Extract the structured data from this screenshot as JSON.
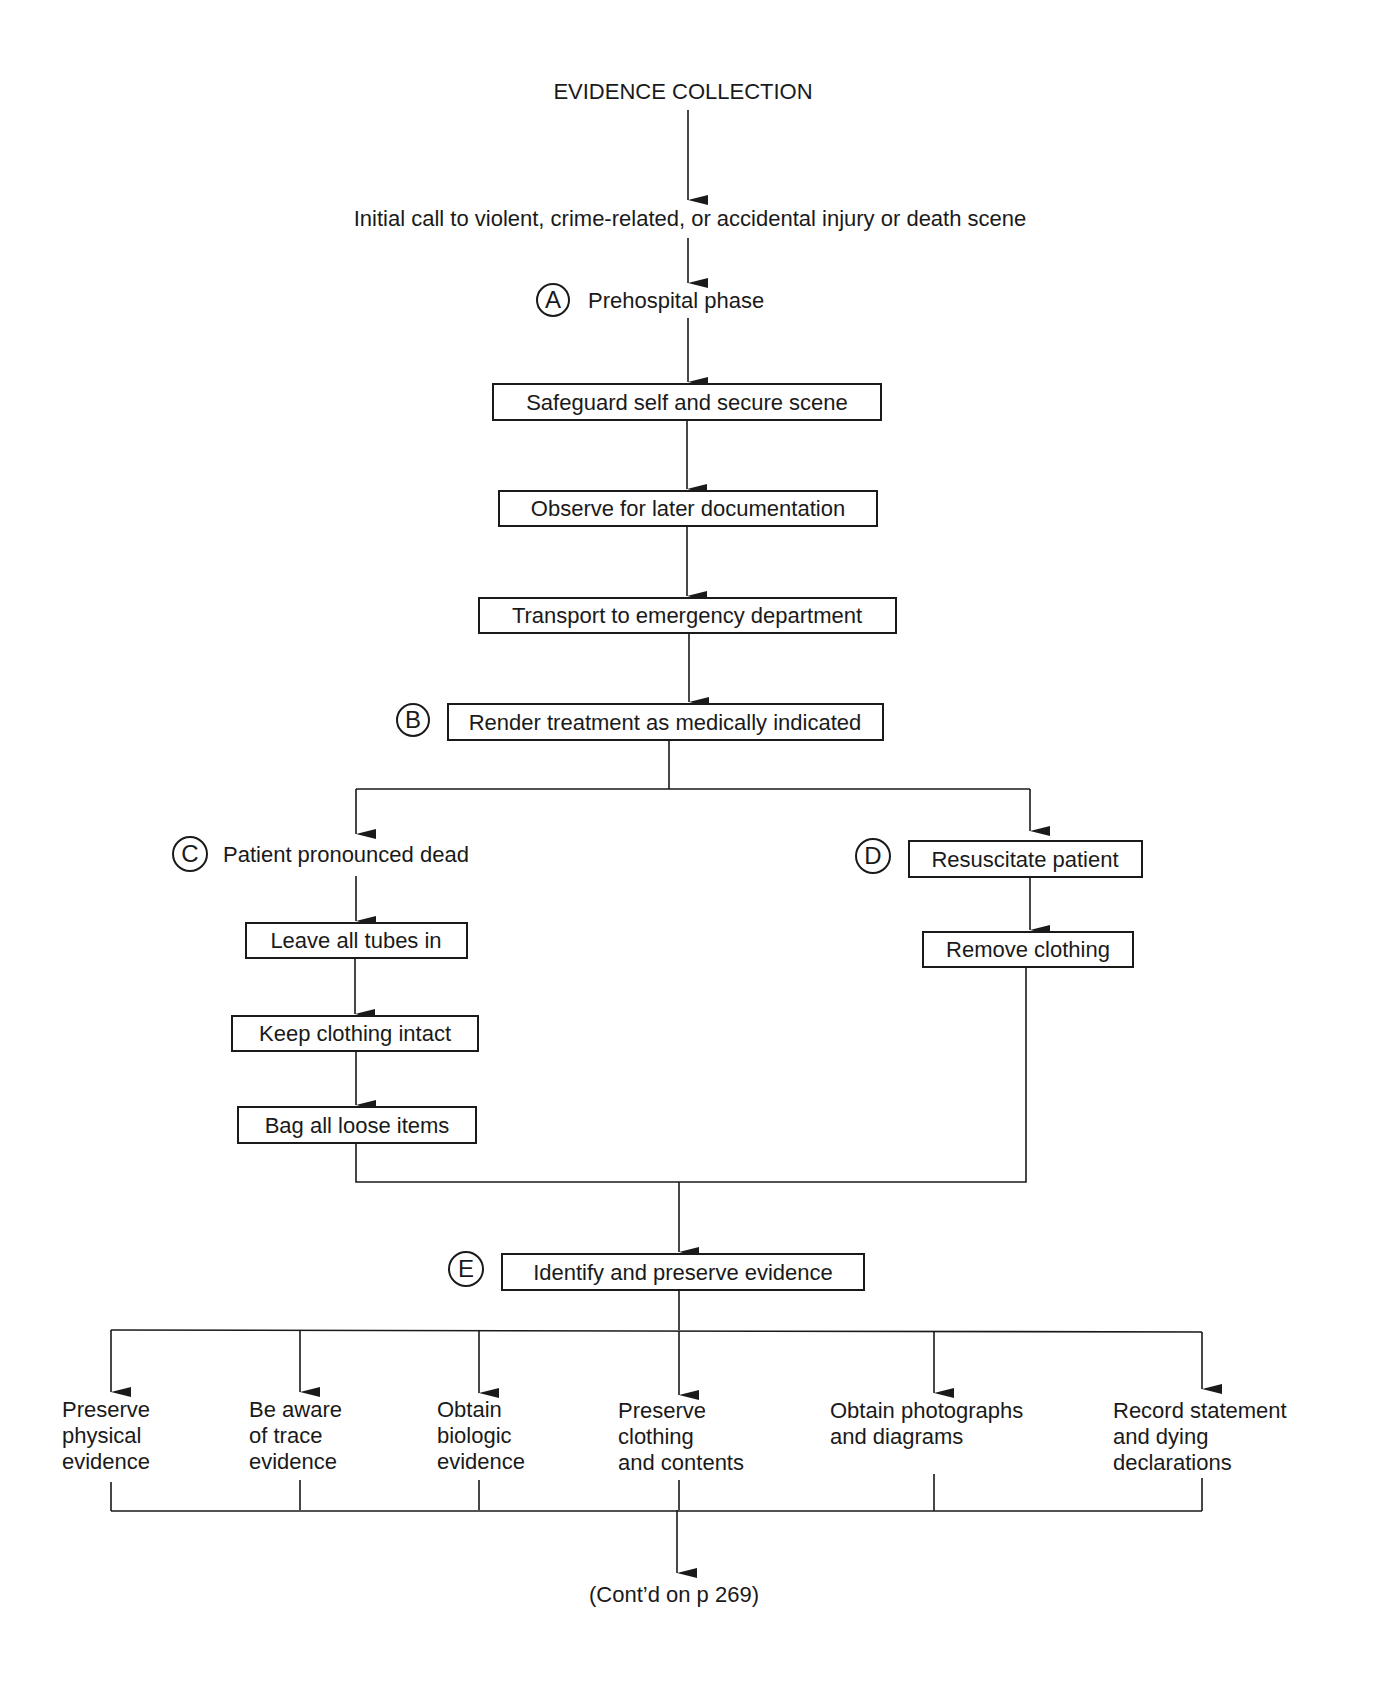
{
  "title": "EVIDENCE COLLECTION",
  "initial_call": "Initial call to violent, crime-related, or accidental injury or death scene",
  "phase_a": {
    "marker": "A",
    "label": "Prehospital phase"
  },
  "prehospital_steps": [
    "Safeguard self and secure scene",
    "Observe for later documentation",
    "Transport to emergency department"
  ],
  "phase_b": {
    "marker": "B",
    "label": "Render treatment as medically indicated"
  },
  "branch_c": {
    "marker": "C",
    "label": "Patient pronounced dead",
    "steps": [
      "Leave all tubes in",
      "Keep clothing intact",
      "Bag all loose items"
    ]
  },
  "branch_d": {
    "marker": "D",
    "label": "Resuscitate patient",
    "steps": [
      "Remove clothing"
    ]
  },
  "phase_e": {
    "marker": "E",
    "label": "Identify and preserve evidence"
  },
  "evidence_actions": [
    {
      "lines": [
        "Preserve",
        "physical",
        "evidence"
      ]
    },
    {
      "lines": [
        "Be aware",
        "of trace",
        "evidence"
      ]
    },
    {
      "lines": [
        "Obtain",
        "biologic",
        "evidence"
      ]
    },
    {
      "lines": [
        "Preserve",
        "clothing",
        "and contents"
      ]
    },
    {
      "lines": [
        "Obtain photographs",
        "and diagrams"
      ]
    },
    {
      "lines": [
        "Record statement",
        "and dying",
        "declarations"
      ]
    }
  ],
  "continuation": "(Cont’d on p 269)"
}
